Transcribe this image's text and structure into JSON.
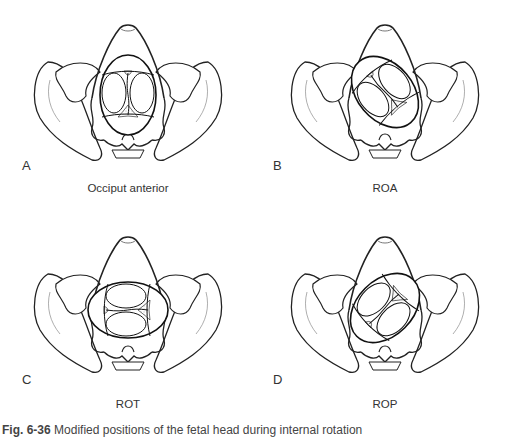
{
  "figure": {
    "panels": [
      {
        "letter": "A",
        "label": "Occiput anterior",
        "rotation": 0
      },
      {
        "letter": "B",
        "label": "ROA",
        "rotation": -40
      },
      {
        "letter": "C",
        "label": "ROT",
        "rotation": -90
      },
      {
        "letter": "D",
        "label": "ROP",
        "rotation": -135
      }
    ],
    "caption": {
      "number": "Fig. 6-36",
      "text": "Modified positions of the fetal head during internal rotation"
    }
  }
}
